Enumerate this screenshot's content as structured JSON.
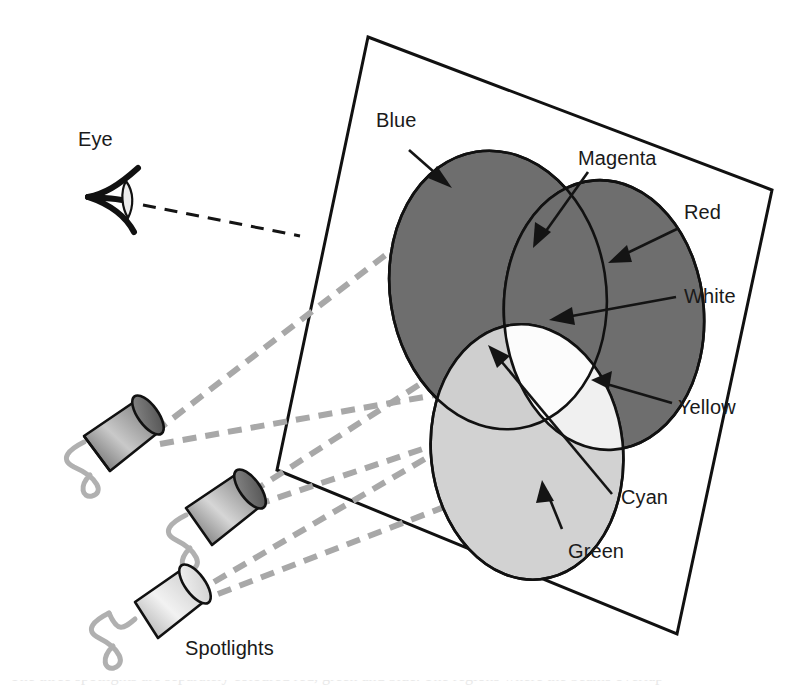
{
  "figure": {
    "background_color": "#ffffff",
    "width": 796,
    "height": 696
  },
  "palette": {
    "dark_gray_fill": "#6e6e6e",
    "light_gray_fill": "#d2d2d2",
    "white_fill": "#fcfcfc",
    "outline": "#111111",
    "beam_gray": "#a8a8a8",
    "cable_gray": "#b0b0b0"
  },
  "labels": {
    "eye": "Eye",
    "blue": "Blue",
    "magenta": "Magenta",
    "red": "Red",
    "white": "White",
    "yellow": "Yellow",
    "cyan": "Cyan",
    "green": "Green",
    "spotlights": "Spotlights"
  },
  "regions": [
    {
      "name": "Blue",
      "label": "Blue",
      "tone": "dark",
      "fill": "#6e6e6e"
    },
    {
      "name": "Red",
      "label": "Red",
      "tone": "dark",
      "fill": "#6e6e6e"
    },
    {
      "name": "Green",
      "label": "Green",
      "tone": "light",
      "fill": "#d2d2d2"
    },
    {
      "name": "Magenta",
      "label": "Magenta",
      "tone": "dark",
      "fill": "#6e6e6e"
    },
    {
      "name": "Cyan",
      "label": "Cyan",
      "tone": "light",
      "fill": "#d2d2d2"
    },
    {
      "name": "Yellow",
      "label": "Yellow",
      "tone": "light",
      "fill": "#e8e8e8"
    },
    {
      "name": "White",
      "label": "White",
      "tone": "white",
      "fill": "#fcfcfc"
    }
  ],
  "spotlights": {
    "count": 3,
    "caption": "Spotlights"
  },
  "bottom_caption": {
    "text": "The three spotlights are separately coloured red, green and blue. The regions where the beams overlap"
  }
}
